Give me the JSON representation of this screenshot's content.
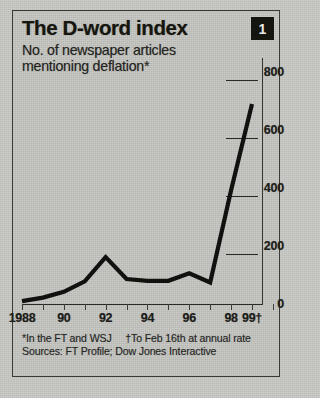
{
  "header": {
    "title": "The D-word index",
    "badge": "1",
    "subtitle_line1": "No. of newspaper articles",
    "subtitle_line2": "mentioning deflation*"
  },
  "footnotes": {
    "note_asterisk": "*In the FT and WSJ",
    "note_dagger": "†To Feb 16th at annual rate",
    "sources": "Sources: FT Profile; Dow Jones Interactive"
  },
  "colors": {
    "ink": "#16160f",
    "line": "#111110",
    "paper": "#c6c6c2",
    "badge_bg": "#15150f",
    "badge_fg": "#e8e8e4"
  },
  "chart_data": {
    "type": "line",
    "title": "The D-word index",
    "subtitle": "No. of newspaper articles mentioning deflation*",
    "xlabel": "",
    "ylabel": "",
    "ylim": [
      0,
      800
    ],
    "yticks": [
      0,
      200,
      400,
      600,
      800
    ],
    "ytick_labels": [
      "0",
      "200",
      "400",
      "600",
      "800"
    ],
    "y_axis_position": "right",
    "grid": false,
    "legend": false,
    "x": [
      1988,
      1989,
      1990,
      1991,
      1992,
      1993,
      1994,
      1995,
      1996,
      1997,
      1998,
      1999
    ],
    "xtick_labels": [
      "1988",
      "",
      "90",
      "",
      "92",
      "",
      "94",
      "",
      "96",
      "",
      "98",
      "99†"
    ],
    "x_major_labels": [
      "1988",
      "90",
      "92",
      "94",
      "96",
      "98",
      "99†"
    ],
    "values": [
      10,
      22,
      42,
      78,
      162,
      86,
      80,
      80,
      106,
      74,
      392,
      690
    ],
    "series": [
      {
        "name": "Articles mentioning deflation",
        "values": [
          10,
          22,
          42,
          78,
          162,
          86,
          80,
          80,
          106,
          74,
          392,
          690
        ]
      }
    ],
    "annotations": [
      "*In the FT and WSJ",
      "†To Feb 16th at annual rate",
      "Sources: FT Profile; Dow Jones Interactive"
    ]
  }
}
